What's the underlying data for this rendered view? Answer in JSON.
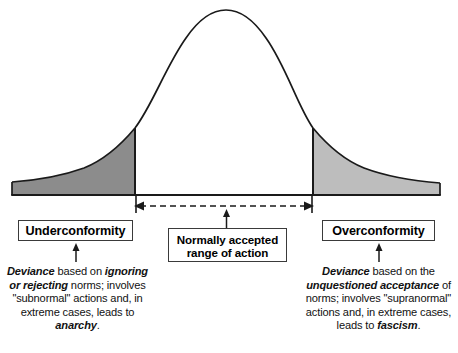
{
  "chart_data": {
    "type": "area",
    "xlabel": "",
    "ylabel": "",
    "grid": false,
    "legend": "none",
    "regions": [
      {
        "name": "Underconformity",
        "position": "left-tail",
        "fill_color": "#8c8c8c",
        "x_range_px": [
          12,
          135
        ]
      },
      {
        "name": "Normally accepted range of action",
        "position": "center",
        "fill_color": "#ffffff",
        "x_range_px": [
          135,
          313
        ]
      },
      {
        "name": "Overconformity",
        "position": "right-tail",
        "fill_color": "#bdbdbd",
        "x_range_px": [
          313,
          440
        ]
      }
    ],
    "curve": {
      "peak_x_px": 226,
      "peak_y_px": 10,
      "baseline_y_px": 195,
      "left_edge_px": 12,
      "right_edge_px": 440
    }
  },
  "colors": {
    "left_tail_fill": "#8c8c8c",
    "right_tail_fill": "#bdbdbd",
    "curve_stroke": "#1a1a1a",
    "box_border": "#3a3a3a",
    "text": "#111111",
    "background": "#ffffff"
  },
  "boxes": {
    "underconformity": "Underconformity",
    "overconformity": "Overconformity",
    "center_line_1": "Normally accepted",
    "center_line_2": "range of action"
  },
  "descriptions": {
    "left": {
      "segments": [
        {
          "text": "Deviance",
          "bold": true
        },
        {
          "text": " based on ",
          "bold": false
        },
        {
          "text": "ignoring or rejecting",
          "bold": true
        },
        {
          "text": " norms; involves \"subnormal\" actions and, in extreme cases, leads to ",
          "bold": false
        },
        {
          "text": "anarchy",
          "bold": true
        },
        {
          "text": ".",
          "bold": false
        }
      ]
    },
    "right": {
      "segments": [
        {
          "text": "Deviance",
          "bold": true
        },
        {
          "text": " based on the ",
          "bold": false
        },
        {
          "text": "unquestioned acceptance",
          "bold": true
        },
        {
          "text": " of norms; involves \"supranormal\" actions and, in extreme cases, leads to ",
          "bold": false
        },
        {
          "text": "fascism",
          "bold": true
        },
        {
          "text": ".",
          "bold": false
        }
      ]
    }
  },
  "icons": {
    "range_arrow": "double-headed-dashed-arrow-icon",
    "pointer_up": "up-arrow-icon"
  }
}
